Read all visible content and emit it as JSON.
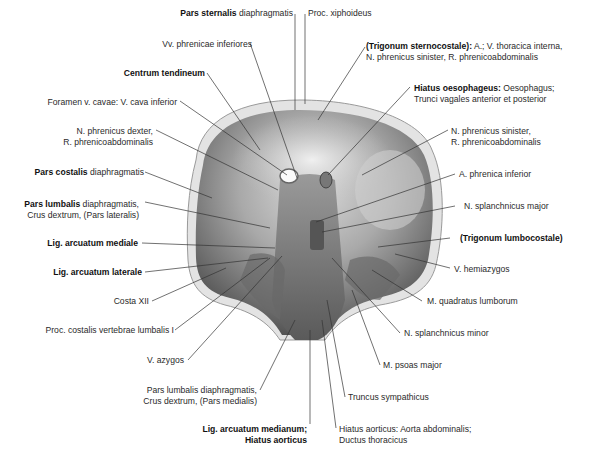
{
  "figure": {
    "labels_left": [
      {
        "id": "pars-sternalis",
        "bold": "Pars sternalis",
        "text": " diaphragmatis"
      },
      {
        "id": "vv-phrenicae",
        "bold": "",
        "text": "Vv. phrenicae inferiores"
      },
      {
        "id": "centrum-tendineum",
        "bold": "Centrum tendineum",
        "text": ""
      },
      {
        "id": "foramen-v-cavae",
        "bold": "",
        "text": "Foramen v. cavae: V. cava inferior"
      },
      {
        "id": "n-phrenicus-dexter",
        "bold": "",
        "text": "N. phrenicus dexter,",
        "line2": "R. phrenicoabdominalis"
      },
      {
        "id": "pars-costalis",
        "bold": "Pars costalis",
        "text": " diaphragmatis"
      },
      {
        "id": "pars-lumbalis-lat",
        "bold": "Pars lumbalis",
        "text": " diaphragmatis,",
        "line2": "Crus dextrum, (Pars lateralis)"
      },
      {
        "id": "lig-arc-mediale",
        "bold": "Lig. arcuatum mediale",
        "text": ""
      },
      {
        "id": "lig-arc-laterale",
        "bold": "Lig. arcuatum laterale",
        "text": ""
      },
      {
        "id": "costa-xii",
        "bold": "",
        "text": "Costa XII"
      },
      {
        "id": "proc-costalis",
        "bold": "",
        "text": "Proc. costalis vertebrae lumbalis I"
      },
      {
        "id": "v-azygos",
        "bold": "",
        "text": "V. azygos"
      },
      {
        "id": "pars-lumbalis-med",
        "bold": "",
        "text": "Pars lumbalis diaphragmatis,",
        "line2": "Crus dextrum, (Pars medialis)"
      },
      {
        "id": "lig-arc-medianum",
        "bold": "Lig. arcuatum medianum;",
        "text": "",
        "line2bold": "Hiatus aorticus"
      }
    ],
    "labels_right": [
      {
        "id": "proc-xiphoideus",
        "bold": "",
        "text": "Proc. xiphoideus"
      },
      {
        "id": "trigonum-sternocostale",
        "bold": "(Trigonum sternocostale):",
        "text": " A.; V. thoracica interna,",
        "line2": "N. phrenicus sinister, R. phrenicoabdominalis"
      },
      {
        "id": "hiatus-oesophageus",
        "bold": "Hiatus oesophageus:",
        "text": " Oesophagus;",
        "line2": "Trunci vagales anterior et posterior"
      },
      {
        "id": "n-phrenicus-sinister",
        "bold": "",
        "text": "N. phrenicus sinister,",
        "line2": "R. phrenicoabdominalis"
      },
      {
        "id": "a-phrenica-inferior",
        "bold": "",
        "text": "A. phrenica inferior"
      },
      {
        "id": "n-splanchnicus-major",
        "bold": "",
        "text": "N. splanchnicus major"
      },
      {
        "id": "trigonum-lumbocostale",
        "bold": "(Trigonum lumbocostale)",
        "text": ""
      },
      {
        "id": "v-hemiazygos",
        "bold": "",
        "text": "V. hemiazygos"
      },
      {
        "id": "m-quadratus",
        "bold": "",
        "text": "M. quadratus lumborum"
      },
      {
        "id": "n-splanchnicus-minor",
        "bold": "",
        "text": "N. splanchnicus minor"
      },
      {
        "id": "m-psoas",
        "bold": "",
        "text": "M. psoas major"
      },
      {
        "id": "truncus-sympathicus",
        "bold": "",
        "text": "Truncus sympathicus"
      },
      {
        "id": "hiatus-aorticus",
        "bold": "",
        "text": "Hiatus aorticus: Aorta abdominalis;",
        "line2": "Ductus thoracicus"
      }
    ]
  }
}
